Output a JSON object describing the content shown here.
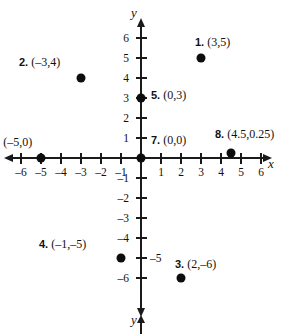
{
  "figure": {
    "type": "cartesian-coordinate-plane",
    "x_axis_label": "x",
    "y_axis_label": "y",
    "y_axis_label_bottom": "y"
  },
  "chart_data": {
    "type": "scatter",
    "title": "",
    "xlabel": "x",
    "ylabel": "y",
    "xlim": [
      -6.8,
      6.8
    ],
    "ylim": [
      -6.8,
      6.8
    ],
    "grid": false,
    "legend": "none",
    "x_ticks": [
      -6,
      -5,
      -4,
      -3,
      -2,
      -1,
      1,
      2,
      3,
      4,
      5,
      6
    ],
    "x_tick_labels": [
      "–6",
      "–5",
      "–4",
      "–3",
      "–2",
      "–1",
      "1",
      "2",
      "3",
      "4",
      "5",
      "6"
    ],
    "y_ticks": [
      6,
      5,
      4,
      3,
      2,
      1,
      -1,
      -2,
      -3,
      -4,
      -5,
      -6
    ],
    "y_tick_labels": [
      "6",
      "5",
      "4",
      "3",
      "2",
      "1",
      "–1",
      "–2",
      "–3",
      "–4",
      "–5",
      "–6"
    ],
    "points": [
      {
        "num": "1.",
        "coord": "(3,5)",
        "x": 3,
        "y": 5
      },
      {
        "num": "2.",
        "coord": "(–3,4)",
        "x": -3,
        "y": 4
      },
      {
        "num": "3.",
        "coord": "(2,–6)",
        "x": 2,
        "y": -6
      },
      {
        "num": "4.",
        "coord": "(–1,–5)",
        "x": -1,
        "y": -5
      },
      {
        "num": "5.",
        "coord": "(0,3)",
        "x": 0,
        "y": 3
      },
      {
        "num": "6.",
        "coord": "(–5,0)",
        "x": -5,
        "y": 0
      },
      {
        "num": "7.",
        "coord": "(0,0)",
        "x": 0,
        "y": 0
      },
      {
        "num": "8.",
        "coord": "(4.5,0.25)",
        "x": 4.5,
        "y": 0.25
      }
    ]
  },
  "geometry": {
    "origin_x": 141,
    "origin_y": 158,
    "unit_px": 20,
    "point_label_offsets": [
      {
        "dx": -6,
        "dy": -22
      },
      {
        "dx": -62,
        "dy": -22
      },
      {
        "dx": -6,
        "dy": -20
      },
      {
        "dx": -82,
        "dy": -20
      },
      {
        "dx": 10,
        "dy": -9
      },
      {
        "dx": -50,
        "dy": -22
      },
      {
        "dx": 10,
        "dy": -24
      },
      {
        "dx": -16,
        "dy": -25
      }
    ]
  },
  "tick_label_sides": {
    "y_right_side_values": [
      -5
    ]
  }
}
